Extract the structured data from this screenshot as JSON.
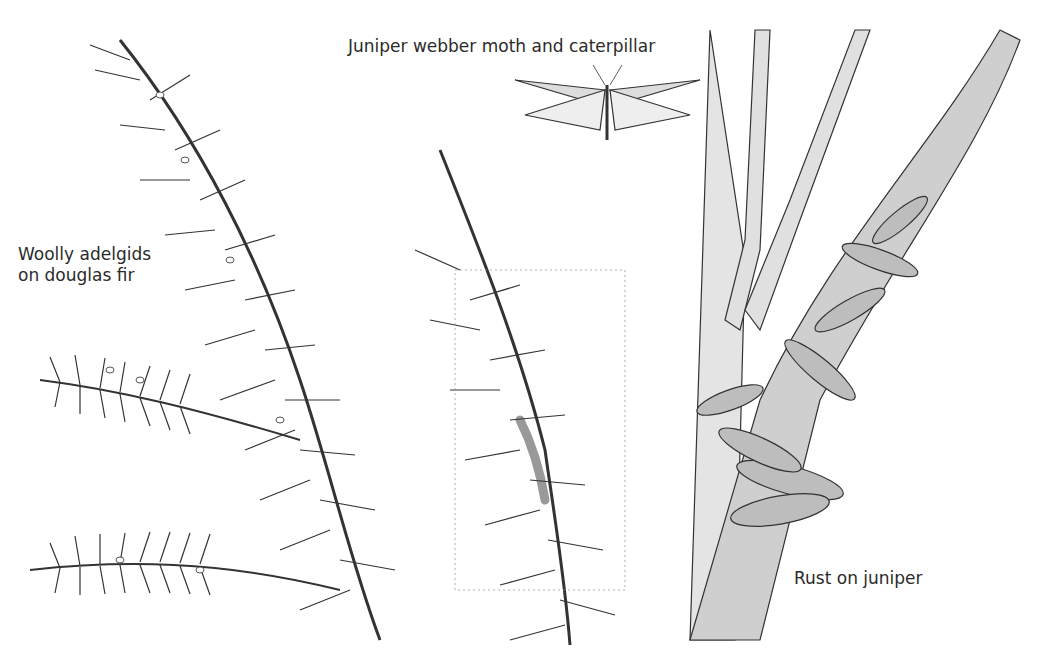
{
  "illustration": {
    "labels": {
      "adelgids_line1": "Woolly adelgids",
      "adelgids_line2": "on douglas fir",
      "webber": "Juniper webber moth and caterpillar",
      "rust": "Rust on juniper"
    },
    "colors": {
      "background": "#ffffff",
      "ink": "#2a2a2a",
      "shade": "#7a7a7a"
    }
  }
}
